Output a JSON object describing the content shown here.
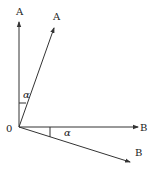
{
  "diagram": {
    "origin_label": "0",
    "vectors": [
      {
        "id": "A",
        "label": "A",
        "direction": "vertical"
      },
      {
        "id": "A_rotated",
        "label": "A",
        "direction": "rotated by alpha from vertical"
      },
      {
        "id": "B",
        "label": "B",
        "direction": "horizontal"
      },
      {
        "id": "B_rotated",
        "label": "B",
        "direction": "rotated by alpha below horizontal"
      }
    ],
    "angles": [
      {
        "label": "α",
        "between": [
          "A",
          "A_rotated"
        ]
      },
      {
        "label": "α",
        "between": [
          "B",
          "B_rotated"
        ]
      }
    ],
    "colors": {
      "line": "#333333",
      "background": "#ffffff"
    }
  }
}
